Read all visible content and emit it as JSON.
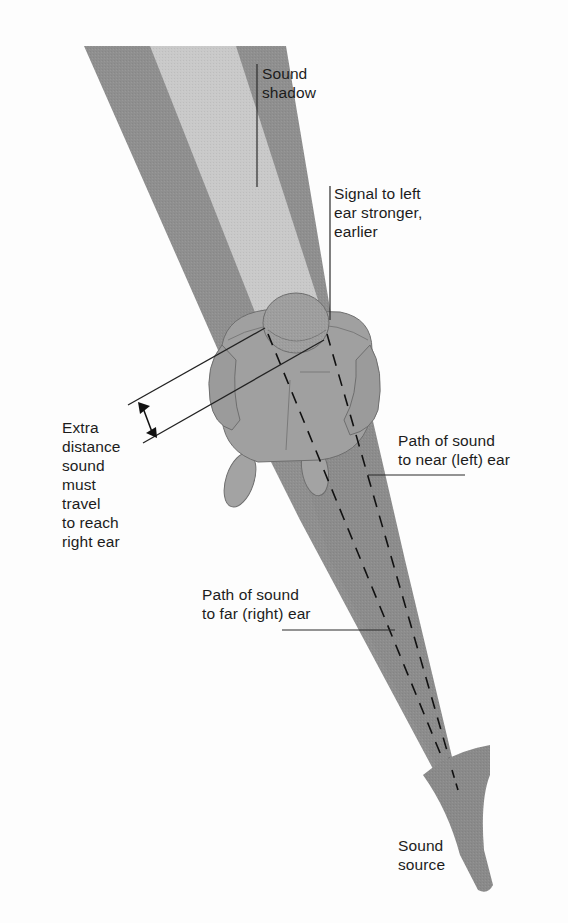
{
  "figure": {
    "colors": {
      "background": "#fdfdfd",
      "beam_dark": "#8f8f8f",
      "shadow_light": "#c9c9c9",
      "person": "#9a9a9a",
      "person_outline": "#6e6e6e",
      "leader_line": "#2a2a2a",
      "text": "#1c1c1c"
    }
  },
  "labels": {
    "sound_shadow": "Sound\nshadow",
    "signal_left_ear": "Signal to left\near stronger,\nearlier",
    "extra_distance": "Extra\ndistance\nsound\nmust\ntravel\nto reach\nright ear",
    "path_near_ear": "Path of sound\nto near (left) ear",
    "path_far_ear": "Path of sound\nto far (right) ear",
    "sound_source": "Sound\nsource"
  }
}
